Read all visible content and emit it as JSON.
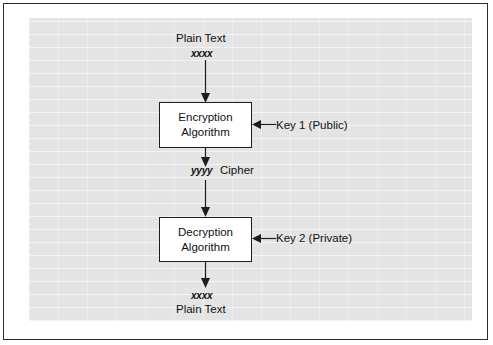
{
  "figure": {
    "panel_bg": "#e4e4e4",
    "frame_color": "#2b2b2b",
    "ink_color": "#111111"
  },
  "nodes": {
    "top_plain_text": "Plain Text",
    "top_variable": "xxxx",
    "encryption_line1": "Encryption",
    "encryption_line2": "Algorithm",
    "cipher_variable": "yyyy",
    "cipher_word": "Cipher",
    "decryption_line1": "Decryption",
    "decryption_line2": "Algorithm",
    "bottom_variable": "xxxx",
    "bottom_plain_text": "Plain Text"
  },
  "keys": {
    "key1": "Key 1 (Public)",
    "key2": "Key 2 (Private)"
  }
}
